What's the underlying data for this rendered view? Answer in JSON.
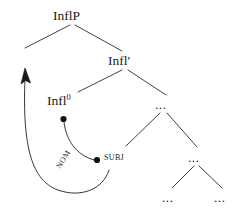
{
  "figure": {
    "kind": "syntactic-tree-diagram",
    "width": 241,
    "height": 208,
    "background_color": "#ffffff",
    "ink_color": "#1a1a1a"
  },
  "tree": {
    "nodes": [
      {
        "id": "inflp",
        "label": "InflP",
        "sup": "",
        "x": 72,
        "y": 16,
        "kind": "phrase"
      },
      {
        "id": "left-gap",
        "label": "",
        "sup": "",
        "x": 25,
        "y": 47,
        "kind": "empty"
      },
      {
        "id": "inflbar",
        "label": "Infl",
        "sup": "",
        "x": 125,
        "y": 61,
        "kind": "bar",
        "prime": "′"
      },
      {
        "id": "infl0",
        "label": "Infl",
        "sup": "0",
        "x": 63,
        "y": 101,
        "kind": "head"
      },
      {
        "id": "dots-mid",
        "label": "...",
        "sup": "",
        "x": 163,
        "y": 104,
        "kind": "ellipsis"
      },
      {
        "id": "subj",
        "label": "SUBJ",
        "sup": "",
        "x": 110,
        "y": 158,
        "kind": "argument"
      },
      {
        "id": "dots-right",
        "label": "...",
        "sup": "",
        "x": 196,
        "y": 157,
        "kind": "ellipsis"
      },
      {
        "id": "dots-bl",
        "label": "...",
        "sup": "",
        "x": 170,
        "y": 197,
        "kind": "ellipsis"
      },
      {
        "id": "dots-br",
        "label": "...",
        "sup": "",
        "x": 222,
        "y": 197,
        "kind": "ellipsis"
      }
    ],
    "branches": [
      {
        "id": "inflp-left",
        "from": "inflp",
        "to": "left-gap"
      },
      {
        "id": "inflp-right",
        "from": "inflp",
        "to": "inflbar"
      },
      {
        "id": "inflbar-left",
        "from": "inflbar",
        "to": "infl0"
      },
      {
        "id": "inflbar-right",
        "from": "inflbar",
        "to": "dots-mid"
      },
      {
        "id": "dotsmid-left",
        "from": "dots-mid",
        "to": "subj"
      },
      {
        "id": "dotsmid-right",
        "from": "dots-mid",
        "to": "dots-right"
      },
      {
        "id": "dotsright-left",
        "from": "dots-right",
        "to": "dots-bl"
      },
      {
        "id": "dotsright-right",
        "from": "dots-right",
        "to": "dots-br"
      }
    ]
  },
  "dependency_arcs": [
    {
      "id": "nom-arc",
      "label": "NOM",
      "from_node": "infl0",
      "to_node": "subj",
      "has_arrowhead": false,
      "endpoint_dots": "both"
    },
    {
      "id": "raising-arc",
      "label": "",
      "from_node": "subj",
      "to_node": "left-gap",
      "has_arrowhead": true,
      "endpoint_dots": "none"
    }
  ],
  "labels": {
    "inflp": "InflP",
    "inflbar": "Infl′",
    "infl0_base": "Infl",
    "infl0_sup": "0",
    "subj": "SUBJ",
    "nom": "NOM",
    "ellipsis": "..."
  }
}
